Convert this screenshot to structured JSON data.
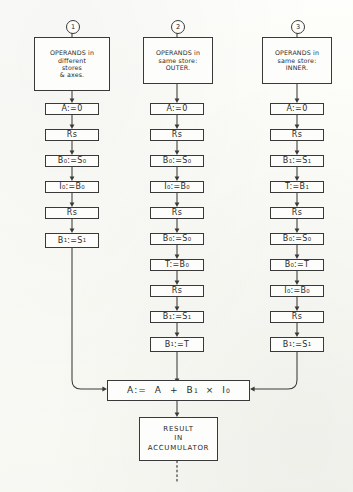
{
  "diagram": {
    "ink_color": "#3a3a38",
    "paper_color": "#fdfdfa"
  },
  "columns": [
    {
      "marker": "1",
      "header_lines": [
        "OPERANDS in",
        "different",
        "stores",
        "& axes."
      ],
      "steps": [
        {
          "label": "A:=0",
          "html": "A:=0"
        },
        {
          "label": "Rs",
          "html": "Rs"
        },
        {
          "label": "B0:=S0",
          "html": "B<sub>0</sub>:=S<sub>0</sub>"
        },
        {
          "label": "I0:=B0",
          "html": "I<sub>0</sub>:=B<sub>0</sub>"
        },
        {
          "label": "Rs",
          "html": "Rs"
        },
        {
          "label": "B1:=S1",
          "html": "B<sub>1</sub>:=S<sub>1</sub>"
        }
      ]
    },
    {
      "marker": "2",
      "header_lines": [
        "OPERANDS in",
        "same store:",
        "OUTER."
      ],
      "steps": [
        {
          "label": "A:=0",
          "html": "A:=0"
        },
        {
          "label": "Rs",
          "html": "Rs"
        },
        {
          "label": "B0:=S0",
          "html": "B<sub>0</sub>:=S<sub>0</sub>"
        },
        {
          "label": "I0:=B0",
          "html": "I<sub>0</sub>:=B<sub>0</sub>"
        },
        {
          "label": "Rs",
          "html": "Rs"
        },
        {
          "label": "B0:=S0",
          "html": "B<sub>0</sub>:=S<sub>0</sub>"
        },
        {
          "label": "T:=B0",
          "html": "T:=B<sub>0</sub>"
        },
        {
          "label": "Rs",
          "html": "Rs"
        },
        {
          "label": "B1:=S1",
          "html": "B<sub>1</sub>:=S<sub>1</sub>"
        },
        {
          "label": "B1:=T",
          "html": "B<sub>1</sub>:=T"
        }
      ]
    },
    {
      "marker": "3",
      "header_lines": [
        "OPERANDS in",
        "same store:",
        "INNER."
      ],
      "steps": [
        {
          "label": "A:=0",
          "html": "A:=0"
        },
        {
          "label": "Rs",
          "html": "Rs"
        },
        {
          "label": "B1:=S1",
          "html": "B<sub>1</sub>:=S<sub>1</sub>"
        },
        {
          "label": "T:=B1",
          "html": "T:=B<sub>1</sub>"
        },
        {
          "label": "Rs",
          "html": "Rs"
        },
        {
          "label": "B0:=S0",
          "html": "B<sub>0</sub>:=S<sub>0</sub>"
        },
        {
          "label": "B0:=T",
          "html": "B<sub>0</sub>:=T"
        },
        {
          "label": "I0:=B0",
          "html": "I<sub>0</sub>:=B<sub>0</sub>"
        },
        {
          "label": "Rs",
          "html": "Rs"
        },
        {
          "label": "B1:=S1",
          "html": "B<sub>1</sub>:=S<sub>1</sub>"
        }
      ]
    }
  ],
  "accumulator": {
    "label": "A:= A + B1 x I0",
    "html": "A:=&nbsp; A&nbsp; +&nbsp; B<sub>1</sub>&nbsp; &times;&nbsp; I<sub>0</sub>"
  },
  "result": {
    "lines": [
      "RESULT",
      "IN",
      "ACCUMULATOR"
    ]
  }
}
